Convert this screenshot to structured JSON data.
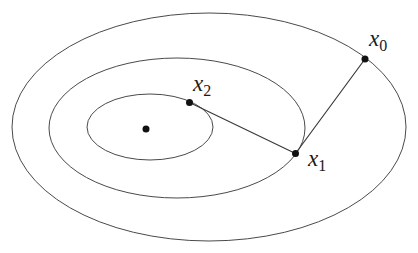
{
  "figure": {
    "background_color": "#ffffff",
    "colors": {
      "curve": "#4a4a4a",
      "segment": "#3a3a3a",
      "dot": "#111111",
      "label": "#1a1a1a"
    },
    "canvas": {
      "width": 418,
      "height": 253
    },
    "ellipses": [
      {
        "name": "outer-level-curve",
        "cx": 209,
        "cy": 127,
        "rx": 197,
        "ry": 114
      },
      {
        "name": "middle-level-curve",
        "cx": 177,
        "cy": 128,
        "rx": 128,
        "ry": 70
      },
      {
        "name": "inner-level-curve",
        "cx": 150,
        "cy": 127,
        "rx": 63,
        "ry": 33
      }
    ],
    "segments": [
      {
        "name": "step-x0-x1",
        "x1": 365,
        "y1": 59,
        "x2": 295.5,
        "y2": 153.5
      },
      {
        "name": "step-x1-x2",
        "x1": 295.5,
        "y1": 153.5,
        "x2": 189.5,
        "y2": 102.5
      }
    ],
    "points": [
      {
        "name": "point-x0",
        "x": 365,
        "y": 59,
        "r": 3.5,
        "label": "x",
        "sub": "0",
        "label_x": 369,
        "label_y": 46,
        "sub_dy": 5
      },
      {
        "name": "point-x1",
        "x": 295.5,
        "y": 153.5,
        "r": 3.5,
        "label": "x",
        "sub": "1",
        "label_x": 308,
        "label_y": 166,
        "sub_dy": 5
      },
      {
        "name": "point-x2",
        "x": 189.5,
        "y": 102.5,
        "r": 3.5,
        "label": "x",
        "sub": "2",
        "label_x": 193,
        "label_y": 91,
        "sub_dy": 5
      },
      {
        "name": "point-center",
        "x": 146,
        "y": 129,
        "r": 3.5,
        "label": "",
        "sub": "",
        "label_x": 0,
        "label_y": 0,
        "sub_dy": 0
      }
    ]
  }
}
